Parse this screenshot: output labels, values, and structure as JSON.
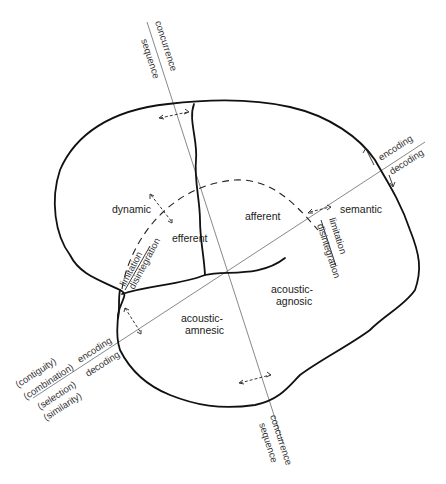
{
  "diagram": {
    "regions": {
      "dynamic": "dynamic",
      "efferent": "efferent",
      "afferent": "afferent",
      "semantic": "semantic",
      "acoustic_agnosic_1": "acoustic-",
      "acoustic_agnosic_2": "agnosic",
      "acoustic_amnesic_1": "acoustic-",
      "acoustic_amnesic_2": "amnesic"
    },
    "axes": {
      "vertical_top": {
        "upper": "concurrence",
        "lower": "sequence"
      },
      "vertical_bottom": {
        "upper": "concurrence",
        "lower": "sequence"
      },
      "diagonal_right": {
        "upper": "encoding",
        "lower": "decoding"
      },
      "diagonal_left": {
        "encoding": "encoding",
        "decoding": "decoding",
        "contiguity": "(contiguity)",
        "combination": "(combination)",
        "selection": "(selection)",
        "similarity": "(similarity)"
      }
    },
    "arc_labels": {
      "left_limitation": "limitation",
      "left_disintegration": "disintegration",
      "right_limitation": "limitation",
      "right_disintegration": "disintegration"
    },
    "colors": {
      "ink": "#111111",
      "axis": "#555555",
      "background": "#ffffff"
    }
  }
}
